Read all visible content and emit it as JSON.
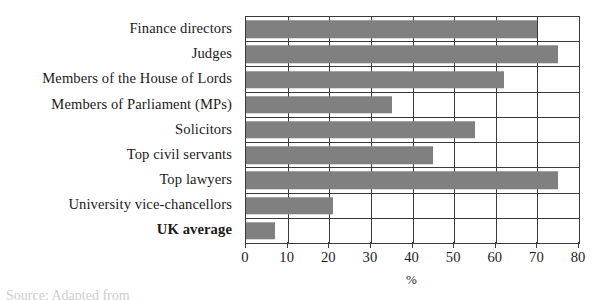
{
  "chart_data": {
    "type": "bar",
    "orientation": "horizontal",
    "title": "",
    "xlabel": "%",
    "ylabel": "",
    "xlim": [
      0,
      80
    ],
    "xticks": [
      0,
      10,
      20,
      30,
      40,
      50,
      60,
      70,
      80
    ],
    "grid": true,
    "legend": null,
    "bar_color": "#808080",
    "categories": [
      "Finance directors",
      "Judges",
      "Members of the House of Lords",
      "Members of Parliament (MPs)",
      "Solicitors",
      "Top civil servants",
      "Top lawyers",
      "University vice-chancellors",
      "UK average"
    ],
    "values": [
      70,
      75,
      62,
      35,
      55,
      45,
      75,
      21,
      7
    ],
    "emphasized_categories": [
      "UK average"
    ]
  },
  "footer": {
    "source_note": "Source: Adapted from"
  }
}
